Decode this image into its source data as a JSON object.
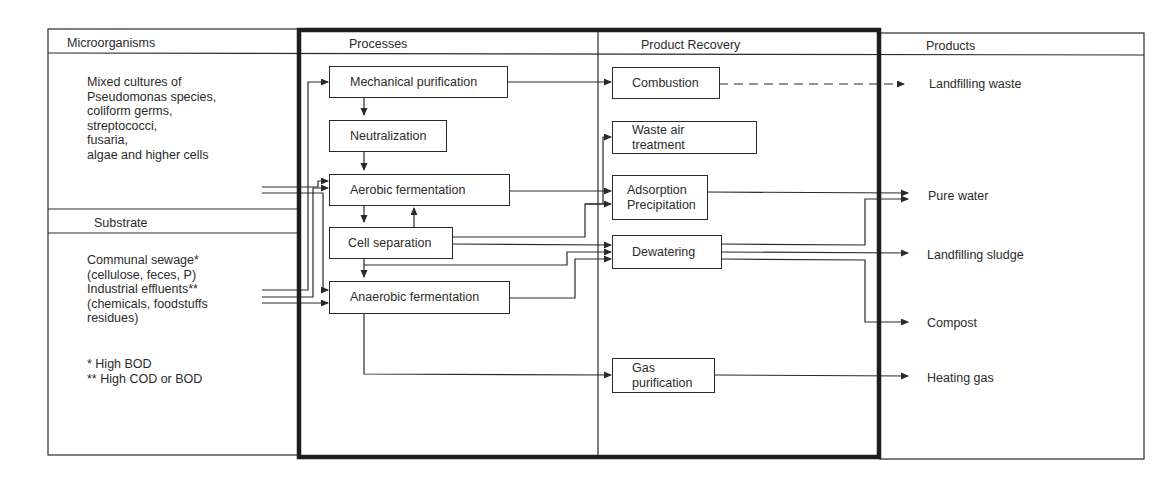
{
  "columns": {
    "microorganisms": {
      "header": "Microorganisms"
    },
    "processes": {
      "header": "Processes"
    },
    "product_recovery": {
      "header": "Product Recovery"
    },
    "products": {
      "header": "Products"
    }
  },
  "microorganisms": {
    "lines": [
      "Mixed cultures of",
      "Pseudomonas species,",
      "coliform germs,",
      "streptococci,",
      "fusaria,",
      "algae and higher cells"
    ]
  },
  "substrate": {
    "header": "Substrate",
    "lines": [
      "Communal sewage*",
      "(cellulose, feces, P)",
      "Industrial effluents**",
      "(chemicals, foodstuffs",
      "residues)"
    ],
    "footnotes": [
      "* High BOD",
      "** High COD or BOD"
    ]
  },
  "processes": [
    {
      "id": "mechanical-purification",
      "label": "Mechanical  purification"
    },
    {
      "id": "neutralization",
      "label": "Neutralization"
    },
    {
      "id": "aerobic-fermentation",
      "label": "Aerobic  fermentation"
    },
    {
      "id": "cell-separation",
      "label": "Cell  separation"
    },
    {
      "id": "anaerobic-fermentation",
      "label": "Anaerobic fermentation"
    }
  ],
  "recovery": [
    {
      "id": "combustion",
      "label": "Combustion"
    },
    {
      "id": "waste-air-treatment",
      "label": "Waste air\ntreatment"
    },
    {
      "id": "adsorption-precipitation",
      "label": "Adsorption\nPrecipitation"
    },
    {
      "id": "dewatering",
      "label": "Dewatering"
    },
    {
      "id": "gas-purification",
      "label": "Gas\npurification"
    }
  ],
  "products": [
    {
      "id": "landfilling-waste",
      "label": "Landfilling waste"
    },
    {
      "id": "pure-water",
      "label": "Pure water"
    },
    {
      "id": "landfilling-sludge",
      "label": "Landfilling sludge"
    },
    {
      "id": "compost",
      "label": "Compost"
    },
    {
      "id": "heating-gas",
      "label": "Heating gas"
    }
  ],
  "flows": [
    {
      "from": "microorganisms",
      "to": "aerobic-fermentation"
    },
    {
      "from": "microorganisms",
      "to": "anaerobic-fermentation"
    },
    {
      "from": "substrate",
      "to": "mechanical-purification"
    },
    {
      "from": "substrate",
      "to": "aerobic-fermentation"
    },
    {
      "from": "substrate",
      "to": "anaerobic-fermentation"
    },
    {
      "from": "mechanical-purification",
      "to": "neutralization"
    },
    {
      "from": "mechanical-purification",
      "to": "combustion"
    },
    {
      "from": "neutralization",
      "to": "aerobic-fermentation"
    },
    {
      "from": "aerobic-fermentation",
      "to": "cell-separation"
    },
    {
      "from": "cell-separation",
      "to": "aerobic-fermentation"
    },
    {
      "from": "cell-separation",
      "to": "anaerobic-fermentation"
    },
    {
      "from": "aerobic-fermentation",
      "to": "adsorption-precipitation"
    },
    {
      "from": "cell-separation",
      "to": "waste-air-treatment"
    },
    {
      "from": "cell-separation",
      "to": "adsorption-precipitation"
    },
    {
      "from": "cell-separation",
      "to": "dewatering"
    },
    {
      "from": "anaerobic-fermentation",
      "to": "dewatering"
    },
    {
      "from": "anaerobic-fermentation",
      "to": "gas-purification"
    },
    {
      "from": "combustion",
      "to": "landfilling-waste",
      "style": "dashed"
    },
    {
      "from": "adsorption-precipitation",
      "to": "pure-water"
    },
    {
      "from": "dewatering",
      "to": "pure-water"
    },
    {
      "from": "dewatering",
      "to": "landfilling-sludge"
    },
    {
      "from": "dewatering",
      "to": "compost"
    },
    {
      "from": "gas-purification",
      "to": "heating-gas"
    }
  ],
  "colors": {
    "line": "#2a2a2a",
    "frame": "#1e1e1e",
    "text": "#2b2b2b",
    "background": "#ffffff"
  }
}
